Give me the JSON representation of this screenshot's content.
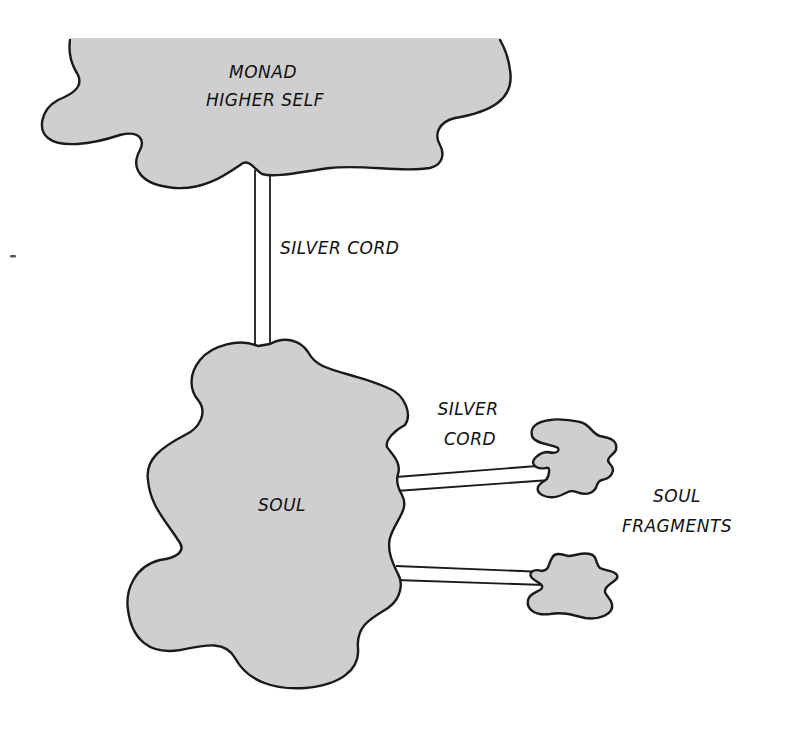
{
  "diagram": {
    "colors": {
      "cloud_fill": "#cfcfcf",
      "outline": "#1a1a1a",
      "cord_fill": "#ffffff",
      "background": "#ffffff"
    },
    "nodes": {
      "monad": {
        "label_line1": "MONAD",
        "label_line2": "HIGHER SELF"
      },
      "soul": {
        "label": "SOUL"
      },
      "fragments": {
        "label_line1": "SOUL",
        "label_line2": "FRAGMENTS",
        "count": 2
      }
    },
    "edges": {
      "monad_to_soul": {
        "label": "SILVER CORD"
      },
      "soul_to_fragments": {
        "label_line1": "SILVER",
        "label_line2": "CORD"
      }
    }
  }
}
